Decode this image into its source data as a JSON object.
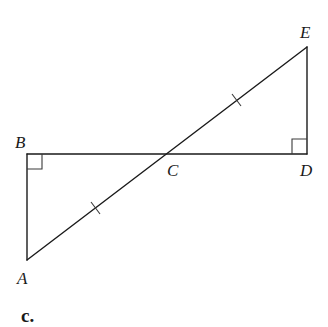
{
  "diagram": {
    "points": {
      "A": {
        "label": "A",
        "x": 27,
        "y": 260
      },
      "B": {
        "label": "B",
        "x": 27,
        "y": 154
      },
      "C": {
        "label": "C",
        "x": 166,
        "y": 154
      },
      "D": {
        "label": "D",
        "x": 307,
        "y": 154
      },
      "E": {
        "label": "E",
        "x": 307,
        "y": 47
      }
    },
    "segments": [
      "AB",
      "BD",
      "DE",
      "AE"
    ],
    "right_angles": [
      "B",
      "D"
    ],
    "congruence_marks": [
      "AC",
      "CE"
    ],
    "caption": "c."
  }
}
